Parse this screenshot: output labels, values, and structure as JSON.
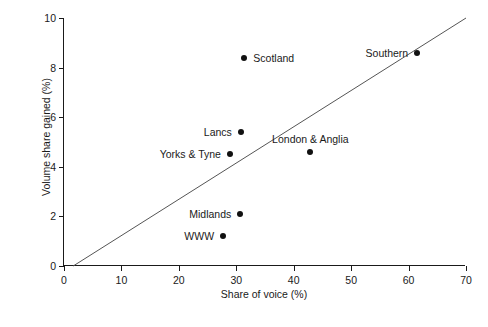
{
  "chart_data": {
    "type": "scatter",
    "title": "",
    "xlabel": "Share of voice (%)",
    "ylabel": "Volume share gained (%)",
    "xlim": [
      0,
      70
    ],
    "ylim": [
      0,
      10
    ],
    "xticks": [
      0,
      10,
      20,
      30,
      40,
      50,
      60,
      70
    ],
    "yticks": [
      0,
      2,
      4,
      6,
      8,
      10
    ],
    "grid": false,
    "legend": "none",
    "point_color": "#111111",
    "line_color": "#555555",
    "points": [
      {
        "label": "Scotland",
        "x": 31.4,
        "y": 8.4,
        "label_pos": "right"
      },
      {
        "label": "Southern",
        "x": 61.5,
        "y": 8.6,
        "label_pos": "left"
      },
      {
        "label": "Lancs",
        "x": 30.8,
        "y": 5.4,
        "label_pos": "left"
      },
      {
        "label": "Yorks & Tyne",
        "x": 28.9,
        "y": 4.5,
        "label_pos": "left"
      },
      {
        "label": "London & Anglia",
        "x": 42.9,
        "y": 4.6,
        "label_pos": "above"
      },
      {
        "label": "Midlands",
        "x": 30.7,
        "y": 2.1,
        "label_pos": "left"
      },
      {
        "label": "WWW",
        "x": 27.7,
        "y": 1.2,
        "label_pos": "left"
      }
    ],
    "trend_line": {
      "x0": 1.6,
      "y0": 0,
      "x1": 70,
      "y1": 10
    }
  }
}
